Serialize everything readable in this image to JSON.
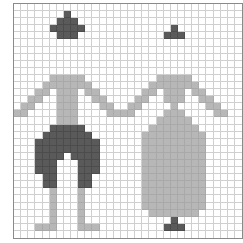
{
  "pattern": {
    "description": "Pixel-grid chart showing a man and a woman holding hands",
    "columns": 32,
    "rows": 33,
    "legend": {
      ".": "empty",
      "D": "dark",
      "L": "light"
    },
    "colors": {
      "empty": "#ffffff",
      "dark": "#5a5a5a",
      "light": "#b7b7b7",
      "grid_line": "#cfcfcf",
      "border": "#8a8a8a"
    },
    "grid": [
      "................................",
      ".......D........................",
      "......DDD.......................",
      ".....DDDDD............D.........",
      "......DDD............DDD........",
      "................................",
      "................................",
      "................................",
      "................................",
      "................................",
      ".....LLLLL..........LLLLL.......",
      "....LLLLLLL........LLLLLLL......",
      "...LL.LLL.LL......LL.LLL.LL.....",
      "..LL..LLL..LL....LL..LLL..LL....",
      ".LL...LLL...LL..LL....L....LL...",
      "LL....LLL....LLLL....LLL....LL..",
      "......LLL...........LLLLL.......",
      ".....DDDDD.........LLLLLLL......",
      "....DDDDDDD.......LLLLLLLLL.....",
      "...DDDDDDDDD......LLLLLLLLL.....",
      "...DDDDDDDDD......LLLLLLLLL.....",
      "...DDDD.DDDD......LLLLLLLLL.....",
      "...DDD...DDD......LLLLLLLLL.....",
      "...DDD...DDD......LLLLLLLLL.....",
      "....DD...DD.......LLLLLLLLL.....",
      "....DD...DD.......LLLLLLLLL.....",
      ".....L...L........LLLLLLLLL.....",
      ".....L...L........LLLLLLLLL.....",
      ".....L...L........LLLLLLLLL.....",
      ".....L...L.........LLLLLLL......",
      ".....L...L............D.........",
      "...LLL...LLL.........DDD........",
      "................................"
    ]
  }
}
